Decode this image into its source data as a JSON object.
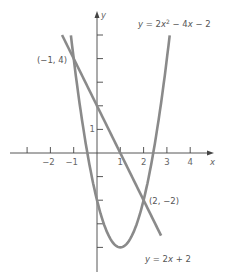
{
  "chart_data": {
    "type": "line",
    "title": "",
    "xlabel": "x",
    "ylabel": "y",
    "xlim": [
      -3.5,
      5
    ],
    "ylim": [
      -5,
      6
    ],
    "x_ticks": [
      -3,
      -2,
      -1,
      1,
      2,
      3,
      4
    ],
    "x_tick_labels": [
      "",
      "−2",
      "−1",
      "1",
      "2",
      "3",
      "4"
    ],
    "y_ticks": [
      5,
      4,
      3,
      2,
      1,
      -1,
      -2,
      -3,
      -4
    ],
    "y_tick_labels": [
      "",
      "",
      "",
      "",
      "1",
      "",
      "",
      "",
      ""
    ],
    "grid": false,
    "series": [
      {
        "name": "y = 2x² − 4x − 2",
        "label_parts": [
          "y",
          " = 2",
          "x",
          "2",
          " − 4",
          "x",
          " − 2"
        ],
        "x": [
          -1.12,
          -1,
          0,
          1,
          2,
          3,
          3.12
        ],
        "y": [
          5,
          4,
          -2,
          -4,
          -2,
          4,
          5
        ]
      },
      {
        "name": "y = 2x + 2",
        "label_parts": [
          "y",
          " = 2",
          "x",
          " + 2"
        ],
        "x": [
          -1.5,
          -1,
          0,
          1,
          2,
          2.75
        ],
        "y": [
          5,
          4,
          2,
          0,
          -2,
          -3.5
        ]
      }
    ],
    "annotations": [
      {
        "text": "(−1, 4)",
        "x": -1,
        "y": 4
      },
      {
        "text": "(2, −2)",
        "x": 2,
        "y": -2
      }
    ],
    "color": "#8a8a8a"
  }
}
